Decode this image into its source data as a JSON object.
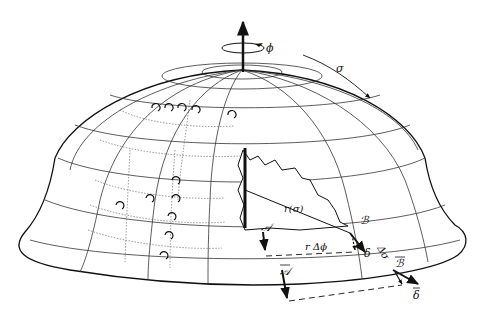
{
  "figure": {
    "colors": {
      "ink": "#111111",
      "background": "#ffffff",
      "grid": "#333333"
    }
  },
  "labels": {
    "phi": "ϕ",
    "sigma": "σ",
    "radius": "r(σ)",
    "point_A": "𝒜",
    "point_B": "ℬ",
    "point_A_bar": "𝒜",
    "point_B_bar": "ℬ",
    "delta": "δ",
    "delta_bar": "δ",
    "delta_sigma": "Δσ",
    "r_delta_phi": "r Δϕ"
  },
  "annotations": {
    "axis_arrow": "axis-of-revolution",
    "rotation_arrow": "circumferential-direction-phi",
    "meridian_arrow": "meridional-direction-sigma"
  }
}
